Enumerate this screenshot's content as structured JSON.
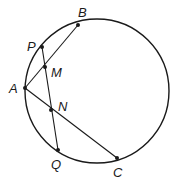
{
  "figure": {
    "type": "circle-geometry",
    "circle": {
      "cx": 97,
      "cy": 91,
      "r": 72
    },
    "points": [
      {
        "name": "B",
        "x": 78,
        "y": 25,
        "label_x": 78,
        "label_y": 17
      },
      {
        "name": "P",
        "x": 42,
        "y": 47,
        "label_x": 27,
        "label_y": 51
      },
      {
        "name": "M",
        "x": 45,
        "y": 67,
        "label_x": 51,
        "label_y": 77
      },
      {
        "name": "A",
        "x": 25,
        "y": 88,
        "label_x": 9,
        "label_y": 93
      },
      {
        "name": "N",
        "x": 51,
        "y": 110,
        "label_x": 58,
        "label_y": 111
      },
      {
        "name": "Q",
        "x": 58,
        "y": 150,
        "label_x": 51,
        "label_y": 169
      },
      {
        "name": "C",
        "x": 117,
        "y": 158,
        "label_x": 113,
        "label_y": 177
      }
    ],
    "segments": [
      {
        "from": "A",
        "to": "B"
      },
      {
        "from": "A",
        "to": "C"
      },
      {
        "from": "P",
        "to": "Q"
      }
    ]
  }
}
